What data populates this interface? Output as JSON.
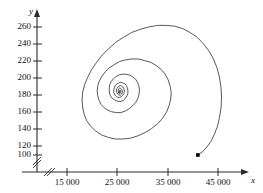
{
  "chart_data": {
    "type": "line",
    "title": "",
    "subtitle": "",
    "xlabel": "x",
    "ylabel": "y",
    "grid": false,
    "legend": "none",
    "axis_break_x": true,
    "axis_break_y": true,
    "xlim": [
      10000,
      49000
    ],
    "ylim": [
      90,
      272
    ],
    "xticks": [
      15000,
      25000,
      35000,
      45000
    ],
    "xticklabels": [
      "15 000",
      "25 000",
      "35 000",
      "45 000"
    ],
    "yticks": [
      100,
      120,
      140,
      160,
      180,
      200,
      220,
      240,
      260
    ],
    "yticklabels": [
      "100",
      "120",
      "140",
      "160",
      "180",
      "200",
      "220",
      "240",
      "260"
    ],
    "series": [
      {
        "name": "phase-trajectory",
        "marker_start": {
          "x": 41000,
          "y": 100,
          "label": ""
        },
        "center": {
          "x": 25300,
          "y": 178
        },
        "points": [
          [
            41000,
            100
          ],
          [
            41900,
            104
          ],
          [
            42800,
            110
          ],
          [
            43600,
            117
          ],
          [
            44300,
            126
          ],
          [
            44900,
            136
          ],
          [
            45300,
            147
          ],
          [
            45600,
            159
          ],
          [
            45700,
            171
          ],
          [
            45600,
            184
          ],
          [
            45300,
            197
          ],
          [
            44800,
            209
          ],
          [
            44100,
            220
          ],
          [
            43200,
            230
          ],
          [
            42100,
            239
          ],
          [
            40900,
            247
          ],
          [
            39500,
            253
          ],
          [
            38000,
            258
          ],
          [
            36400,
            261
          ],
          [
            34700,
            262
          ],
          [
            33000,
            262
          ],
          [
            31200,
            260
          ],
          [
            29500,
            257
          ],
          [
            27800,
            253
          ],
          [
            26200,
            247
          ],
          [
            24700,
            241
          ],
          [
            23300,
            233
          ],
          [
            22000,
            225
          ],
          [
            20900,
            216
          ],
          [
            19900,
            207
          ],
          [
            19100,
            197
          ],
          [
            18500,
            188
          ],
          [
            18100,
            178
          ],
          [
            18000,
            169
          ],
          [
            18100,
            160
          ],
          [
            18400,
            151
          ],
          [
            18900,
            143
          ],
          [
            19700,
            136
          ],
          [
            20700,
            130
          ],
          [
            21900,
            125
          ],
          [
            23200,
            122
          ],
          [
            24600,
            120
          ],
          [
            26100,
            120
          ],
          [
            27600,
            121
          ],
          [
            29100,
            124
          ],
          [
            30500,
            128
          ],
          [
            31800,
            133
          ],
          [
            33000,
            139
          ],
          [
            34000,
            146
          ],
          [
            34800,
            154
          ],
          [
            35300,
            162
          ],
          [
            35600,
            170
          ],
          [
            35700,
            178
          ],
          [
            35500,
            186
          ],
          [
            35100,
            194
          ],
          [
            34500,
            201
          ],
          [
            33700,
            207
          ],
          [
            32700,
            212
          ],
          [
            31600,
            216
          ],
          [
            30400,
            218
          ],
          [
            29200,
            220
          ],
          [
            27900,
            220
          ],
          [
            26700,
            219
          ],
          [
            25500,
            217
          ],
          [
            24400,
            213
          ],
          [
            23400,
            209
          ],
          [
            22600,
            204
          ],
          [
            21900,
            198
          ],
          [
            21400,
            192
          ],
          [
            21100,
            186
          ],
          [
            21000,
            180
          ],
          [
            21100,
            174
          ],
          [
            21400,
            168
          ],
          [
            21800,
            163
          ],
          [
            22400,
            159
          ],
          [
            23100,
            156
          ],
          [
            23900,
            154
          ],
          [
            24800,
            153
          ],
          [
            25700,
            153
          ],
          [
            26600,
            155
          ],
          [
            27400,
            158
          ],
          [
            28100,
            162
          ],
          [
            28700,
            166
          ],
          [
            29100,
            171
          ],
          [
            29300,
            176
          ],
          [
            29400,
            181
          ],
          [
            29300,
            186
          ],
          [
            29000,
            191
          ],
          [
            28600,
            195
          ],
          [
            28000,
            198
          ],
          [
            27400,
            200
          ],
          [
            26700,
            201
          ],
          [
            26000,
            201
          ],
          [
            25300,
            200
          ],
          [
            24700,
            198
          ],
          [
            24200,
            195
          ],
          [
            23800,
            192
          ],
          [
            23500,
            188
          ],
          [
            23400,
            184
          ],
          [
            23400,
            180
          ],
          [
            23500,
            176
          ],
          [
            23800,
            172
          ],
          [
            24200,
            170
          ],
          [
            24700,
            168
          ],
          [
            25200,
            167
          ],
          [
            25700,
            167
          ],
          [
            26200,
            168
          ],
          [
            26600,
            171
          ],
          [
            26900,
            174
          ],
          [
            27100,
            177
          ],
          [
            27100,
            181
          ],
          [
            27000,
            184
          ],
          [
            26800,
            187
          ],
          [
            26500,
            189
          ],
          [
            26100,
            190
          ],
          [
            25700,
            191
          ],
          [
            25300,
            190
          ],
          [
            24900,
            189
          ],
          [
            24600,
            187
          ],
          [
            24400,
            184
          ],
          [
            24300,
            181
          ],
          [
            24300,
            178
          ],
          [
            24500,
            175
          ],
          [
            24800,
            173
          ],
          [
            25100,
            172
          ],
          [
            25500,
            172
          ],
          [
            25800,
            173
          ],
          [
            26100,
            175
          ],
          [
            26300,
            177
          ],
          [
            26400,
            180
          ],
          [
            26300,
            183
          ],
          [
            26100,
            185
          ],
          [
            25900,
            186
          ],
          [
            25600,
            187
          ],
          [
            25300,
            186
          ],
          [
            25100,
            185
          ],
          [
            24900,
            183
          ],
          [
            24800,
            181
          ],
          [
            24900,
            178
          ],
          [
            25100,
            176
          ],
          [
            25300,
            175
          ],
          [
            25600,
            175
          ],
          [
            25800,
            176
          ],
          [
            26000,
            178
          ],
          [
            26000,
            180
          ],
          [
            25900,
            182
          ],
          [
            25700,
            183
          ],
          [
            25500,
            184
          ],
          [
            25300,
            183
          ],
          [
            25200,
            181
          ],
          [
            25200,
            179
          ],
          [
            25300,
            177
          ],
          [
            25500,
            177
          ],
          [
            25700,
            178
          ],
          [
            25700,
            180
          ],
          [
            25600,
            181
          ],
          [
            25450,
            181
          ],
          [
            25350,
            180
          ],
          [
            25350,
            179
          ],
          [
            25450,
            178
          ],
          [
            25550,
            179
          ],
          [
            25500,
            180
          ],
          [
            25400,
            179
          ],
          [
            25380,
            178
          ]
        ]
      }
    ]
  },
  "axes": {
    "x_axis_name": "x",
    "y_axis_name": "y"
  },
  "colors": {
    "curve": "#3a3a3a",
    "axis": "#2b2b2b",
    "text": "#111111",
    "marker": "#000000",
    "background": "#ffffff"
  }
}
